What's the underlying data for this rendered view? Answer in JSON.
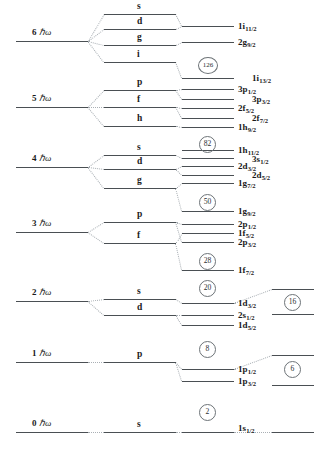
{
  "figure": {
    "type": "energy-level-diagram",
    "width": 315,
    "height": 450,
    "background": "#ffffff",
    "line_color": "#555a5e",
    "connector_color": "#9aa0a5"
  },
  "oscillator_shells": [
    {
      "id": "n6",
      "label": "6 ℏω",
      "n": 6,
      "x": 18,
      "y": 41,
      "line_x": 16,
      "line_w": 72
    },
    {
      "id": "n5",
      "label": "5 ℏω",
      "n": 5,
      "x": 18,
      "y": 107,
      "line_x": 16,
      "line_w": 72
    },
    {
      "id": "n4",
      "label": "4 ℏω",
      "n": 4,
      "x": 18,
      "y": 167,
      "line_x": 16,
      "line_w": 72
    },
    {
      "id": "n3",
      "label": "3 ℏω",
      "n": 3,
      "x": 18,
      "y": 232,
      "line_x": 16,
      "line_w": 72
    },
    {
      "id": "n2",
      "label": "2 ℏω",
      "n": 2,
      "x": 18,
      "y": 301,
      "line_x": 16,
      "line_w": 72
    },
    {
      "id": "n1",
      "label": "1 ℏω",
      "n": 1,
      "x": 18,
      "y": 362,
      "line_x": 16,
      "line_w": 72
    },
    {
      "id": "n0",
      "label": "0 ℏω",
      "n": 0,
      "x": 18,
      "y": 432,
      "line_x": 16,
      "line_w": 72
    }
  ],
  "orbital_letters": [
    {
      "id": "o-6s",
      "label": "s",
      "y": 14,
      "line_x": 104,
      "line_w": 72
    },
    {
      "id": "o-6d",
      "label": "d",
      "y": 29,
      "line_x": 104,
      "line_w": 72
    },
    {
      "id": "o-6g",
      "label": "g",
      "y": 45,
      "line_x": 104,
      "line_w": 72
    },
    {
      "id": "o-6i",
      "label": "i",
      "y": 62,
      "line_x": 104,
      "line_w": 72
    },
    {
      "id": "o-5p",
      "label": "p",
      "y": 90,
      "line_x": 104,
      "line_w": 72
    },
    {
      "id": "o-5f",
      "label": "f",
      "y": 107,
      "line_x": 104,
      "line_w": 72
    },
    {
      "id": "o-5h",
      "label": "h",
      "y": 126,
      "line_x": 104,
      "line_w": 72
    },
    {
      "id": "o-4s",
      "label": "s",
      "y": 155,
      "line_x": 104,
      "line_w": 72
    },
    {
      "id": "o-4d",
      "label": "d",
      "y": 169,
      "line_x": 104,
      "line_w": 72
    },
    {
      "id": "o-4g",
      "label": "g",
      "y": 188,
      "line_x": 104,
      "line_w": 72
    },
    {
      "id": "o-3p",
      "label": "p",
      "y": 222,
      "line_x": 104,
      "line_w": 72
    },
    {
      "id": "o-3f",
      "label": "f",
      "y": 243,
      "line_x": 104,
      "line_w": 72
    },
    {
      "id": "o-2s",
      "label": "s",
      "y": 299,
      "line_x": 104,
      "line_w": 72
    },
    {
      "id": "o-2d",
      "label": "d",
      "y": 315,
      "line_x": 104,
      "line_w": 72
    },
    {
      "id": "o-1p",
      "label": "p",
      "y": 362,
      "line_x": 104,
      "line_w": 72
    },
    {
      "id": "o-0s",
      "label": "s",
      "y": 432,
      "line_x": 104,
      "line_w": 72
    }
  ],
  "spin_orbit_levels": [
    {
      "id": "l-1i11",
      "n": "1",
      "l": "i",
      "j": "11/2",
      "y": 26,
      "line_x": 182,
      "line_w": 52,
      "label_x": 238,
      "label_y": 22
    },
    {
      "id": "l-2g9",
      "n": "2",
      "l": "g",
      "j": "9/2",
      "y": 42,
      "line_x": 182,
      "line_w": 52,
      "label_x": 238,
      "label_y": 38
    },
    {
      "id": "l-1i13",
      "n": "1",
      "l": "i",
      "j": "13/2",
      "y": 78,
      "line_x": 182,
      "line_w": 52,
      "label_x": 252,
      "label_y": 74
    },
    {
      "id": "l-3p1",
      "n": "3",
      "l": "p",
      "j": "1/2",
      "y": 89,
      "line_x": 182,
      "line_w": 52,
      "label_x": 238,
      "label_y": 85
    },
    {
      "id": "l-3p3",
      "n": "3",
      "l": "p",
      "j": "3/2",
      "y": 99,
      "line_x": 182,
      "line_w": 52,
      "label_x": 252,
      "label_y": 95
    },
    {
      "id": "l-2f5",
      "n": "2",
      "l": "f",
      "j": "5/2",
      "y": 108,
      "line_x": 182,
      "line_w": 52,
      "label_x": 238,
      "label_y": 104
    },
    {
      "id": "l-2f7",
      "n": "2",
      "l": "f",
      "j": "7/2",
      "y": 118,
      "line_x": 182,
      "line_w": 52,
      "label_x": 252,
      "label_y": 114
    },
    {
      "id": "l-1h9",
      "n": "1",
      "l": "h",
      "j": "9/2",
      "y": 127,
      "line_x": 182,
      "line_w": 52,
      "label_x": 238,
      "label_y": 123
    },
    {
      "id": "l-1h11",
      "n": "1",
      "l": "h",
      "j": "11/2",
      "y": 150,
      "line_x": 182,
      "line_w": 52,
      "label_x": 238,
      "label_y": 146
    },
    {
      "id": "l-3s1",
      "n": "3",
      "l": "s",
      "j": "1/2",
      "y": 158,
      "line_x": 182,
      "line_w": 52,
      "label_x": 252,
      "label_y": 155
    },
    {
      "id": "l-2d3",
      "n": "2",
      "l": "d",
      "j": "3/2",
      "y": 166,
      "line_x": 182,
      "line_w": 52,
      "label_x": 238,
      "label_y": 162
    },
    {
      "id": "l-2d5",
      "n": "2",
      "l": "d",
      "j": "5/2",
      "y": 175,
      "line_x": 182,
      "line_w": 52,
      "label_x": 252,
      "label_y": 171
    },
    {
      "id": "l-1g7",
      "n": "1",
      "l": "g",
      "j": "7/2",
      "y": 183,
      "line_x": 182,
      "line_w": 52,
      "label_x": 238,
      "label_y": 179
    },
    {
      "id": "l-1g9",
      "n": "1",
      "l": "g",
      "j": "9/2",
      "y": 211,
      "line_x": 182,
      "line_w": 52,
      "label_x": 238,
      "label_y": 207
    },
    {
      "id": "l-2p1",
      "n": "2",
      "l": "p",
      "j": "1/2",
      "y": 224,
      "line_x": 182,
      "line_w": 52,
      "label_x": 238,
      "label_y": 220
    },
    {
      "id": "l-1f5",
      "n": "1",
      "l": "f",
      "j": "5/2",
      "y": 233,
      "line_x": 182,
      "line_w": 52,
      "label_x": 238,
      "label_y": 229
    },
    {
      "id": "l-2p3",
      "n": "2",
      "l": "p",
      "j": "3/2",
      "y": 242,
      "line_x": 182,
      "line_w": 52,
      "label_x": 238,
      "label_y": 238
    },
    {
      "id": "l-1f7",
      "n": "1",
      "l": "f",
      "j": "7/2",
      "y": 270,
      "line_x": 182,
      "line_w": 52,
      "label_x": 238,
      "label_y": 266
    },
    {
      "id": "l-1d3",
      "n": "1",
      "l": "d",
      "j": "3/2",
      "y": 303,
      "line_x": 182,
      "line_w": 52,
      "label_x": 238,
      "label_y": 299
    },
    {
      "id": "l-2s1",
      "n": "2",
      "l": "s",
      "j": "1/2",
      "y": 315,
      "line_x": 182,
      "line_w": 52,
      "label_x": 238,
      "label_y": 311
    },
    {
      "id": "l-1d5",
      "n": "1",
      "l": "d",
      "j": "5/2",
      "y": 325,
      "line_x": 182,
      "line_w": 52,
      "label_x": 238,
      "label_y": 321
    },
    {
      "id": "l-1p1",
      "n": "1",
      "l": "p",
      "j": "1/2",
      "y": 369,
      "line_x": 182,
      "line_w": 52,
      "label_x": 238,
      "label_y": 365
    },
    {
      "id": "l-1p3",
      "n": "1",
      "l": "p",
      "j": "3/2",
      "y": 381,
      "line_x": 182,
      "line_w": 52,
      "label_x": 238,
      "label_y": 377
    },
    {
      "id": "l-1s1",
      "n": "1",
      "l": "s",
      "j": "1/2",
      "y": 432,
      "line_x": 182,
      "line_w": 52,
      "label_x": 238,
      "label_y": 424
    }
  ],
  "far_right_levels": [
    {
      "id": "fr-1",
      "y": 289,
      "line_x": 272,
      "line_w": 42
    },
    {
      "id": "fr-2",
      "y": 314,
      "line_x": 272,
      "line_w": 42
    },
    {
      "id": "fr-3",
      "y": 355,
      "line_x": 272,
      "line_w": 42
    },
    {
      "id": "fr-4",
      "y": 385,
      "line_x": 272,
      "line_w": 42
    },
    {
      "id": "fr-5",
      "y": 432,
      "line_x": 272,
      "line_w": 42
    }
  ],
  "magic_numbers": [
    {
      "id": "m-126",
      "value": "126",
      "x": 198,
      "y": 57,
      "wide": true
    },
    {
      "id": "m-82",
      "value": "82",
      "x": 199,
      "y": 136,
      "wide": false
    },
    {
      "id": "m-50",
      "value": "50",
      "x": 199,
      "y": 194,
      "wide": false
    },
    {
      "id": "m-28",
      "value": "28",
      "x": 199,
      "y": 253,
      "wide": false
    },
    {
      "id": "m-20",
      "value": "20",
      "x": 199,
      "y": 280,
      "wide": false
    },
    {
      "id": "m-16",
      "value": "16",
      "x": 284,
      "y": 294,
      "wide": false
    },
    {
      "id": "m-8",
      "value": "8",
      "x": 199,
      "y": 341,
      "wide": false
    },
    {
      "id": "m-6",
      "value": "6",
      "x": 284,
      "y": 361,
      "wide": false
    },
    {
      "id": "m-2",
      "value": "2",
      "x": 199,
      "y": 404,
      "wide": false
    }
  ],
  "connectors": [
    {
      "id": "c1",
      "x1": 88,
      "y1": 41,
      "x2": 104,
      "y2": 14,
      "style": "dotted"
    },
    {
      "id": "c2",
      "x1": 88,
      "y1": 41,
      "x2": 104,
      "y2": 29,
      "style": "dotted"
    },
    {
      "id": "c3",
      "x1": 88,
      "y1": 41,
      "x2": 104,
      "y2": 45,
      "style": "dotted"
    },
    {
      "id": "c4",
      "x1": 88,
      "y1": 41,
      "x2": 104,
      "y2": 62,
      "style": "dotted"
    },
    {
      "id": "c5",
      "x1": 176,
      "y1": 14,
      "x2": 182,
      "y2": 26,
      "style": "dotted"
    },
    {
      "id": "c6",
      "x1": 176,
      "y1": 29,
      "x2": 182,
      "y2": 26,
      "style": "dotted"
    },
    {
      "id": "c7",
      "x1": 176,
      "y1": 45,
      "x2": 182,
      "y2": 42,
      "style": "dotted"
    },
    {
      "id": "c8",
      "x1": 176,
      "y1": 62,
      "x2": 182,
      "y2": 78,
      "style": "dotted"
    },
    {
      "id": "c9",
      "x1": 88,
      "y1": 107,
      "x2": 104,
      "y2": 90,
      "style": "dotted"
    },
    {
      "id": "c10",
      "x1": 88,
      "y1": 107,
      "x2": 104,
      "y2": 107,
      "style": "dotted"
    },
    {
      "id": "c11",
      "x1": 88,
      "y1": 107,
      "x2": 104,
      "y2": 126,
      "style": "dotted"
    },
    {
      "id": "c12",
      "x1": 176,
      "y1": 90,
      "x2": 182,
      "y2": 89,
      "style": "dotted"
    },
    {
      "id": "c13",
      "x1": 176,
      "y1": 90,
      "x2": 182,
      "y2": 99,
      "style": "dotted"
    },
    {
      "id": "c14",
      "x1": 176,
      "y1": 107,
      "x2": 182,
      "y2": 108,
      "style": "dotted"
    },
    {
      "id": "c15",
      "x1": 176,
      "y1": 107,
      "x2": 182,
      "y2": 118,
      "style": "dotted"
    },
    {
      "id": "c16",
      "x1": 176,
      "y1": 126,
      "x2": 182,
      "y2": 127,
      "style": "dotted"
    },
    {
      "id": "c17",
      "x1": 88,
      "y1": 167,
      "x2": 104,
      "y2": 155,
      "style": "dotted"
    },
    {
      "id": "c18",
      "x1": 88,
      "y1": 167,
      "x2": 104,
      "y2": 169,
      "style": "dotted"
    },
    {
      "id": "c19",
      "x1": 88,
      "y1": 167,
      "x2": 104,
      "y2": 188,
      "style": "dotted"
    },
    {
      "id": "c20",
      "x1": 176,
      "y1": 155,
      "x2": 182,
      "y2": 158,
      "style": "dotted"
    },
    {
      "id": "c21",
      "x1": 176,
      "y1": 169,
      "x2": 182,
      "y2": 166,
      "style": "dotted"
    },
    {
      "id": "c22",
      "x1": 176,
      "y1": 169,
      "x2": 182,
      "y2": 175,
      "style": "dotted"
    },
    {
      "id": "c23",
      "x1": 176,
      "y1": 188,
      "x2": 182,
      "y2": 183,
      "style": "dotted"
    },
    {
      "id": "c24",
      "x1": 176,
      "y1": 188,
      "x2": 182,
      "y2": 211,
      "style": "dotted"
    },
    {
      "id": "c25",
      "x1": 88,
      "y1": 232,
      "x2": 104,
      "y2": 222,
      "style": "dotted"
    },
    {
      "id": "c26",
      "x1": 88,
      "y1": 232,
      "x2": 104,
      "y2": 243,
      "style": "dotted"
    },
    {
      "id": "c27",
      "x1": 176,
      "y1": 222,
      "x2": 182,
      "y2": 224,
      "style": "dotted"
    },
    {
      "id": "c28",
      "x1": 176,
      "y1": 222,
      "x2": 182,
      "y2": 242,
      "style": "dotted"
    },
    {
      "id": "c29",
      "x1": 176,
      "y1": 243,
      "x2": 182,
      "y2": 233,
      "style": "dotted"
    },
    {
      "id": "c30",
      "x1": 176,
      "y1": 243,
      "x2": 182,
      "y2": 270,
      "style": "dotted"
    },
    {
      "id": "c31",
      "x1": 88,
      "y1": 301,
      "x2": 104,
      "y2": 299,
      "style": "dotted"
    },
    {
      "id": "c32",
      "x1": 88,
      "y1": 301,
      "x2": 104,
      "y2": 315,
      "style": "dotted"
    },
    {
      "id": "c33",
      "x1": 176,
      "y1": 299,
      "x2": 182,
      "y2": 303,
      "style": "dotted"
    },
    {
      "id": "c34",
      "x1": 176,
      "y1": 315,
      "x2": 182,
      "y2": 315,
      "style": "dotted"
    },
    {
      "id": "c35",
      "x1": 176,
      "y1": 315,
      "x2": 182,
      "y2": 325,
      "style": "dotted"
    },
    {
      "id": "c36",
      "x1": 234,
      "y1": 303,
      "x2": 272,
      "y2": 289,
      "style": "dotted"
    },
    {
      "id": "c37",
      "x1": 88,
      "y1": 362,
      "x2": 104,
      "y2": 362,
      "style": "dotted"
    },
    {
      "id": "c38",
      "x1": 176,
      "y1": 362,
      "x2": 182,
      "y2": 369,
      "style": "dotted"
    },
    {
      "id": "c39",
      "x1": 176,
      "y1": 362,
      "x2": 182,
      "y2": 381,
      "style": "dotted"
    },
    {
      "id": "c40",
      "x1": 234,
      "y1": 369,
      "x2": 272,
      "y2": 355,
      "style": "dotted"
    },
    {
      "id": "c41",
      "x1": 88,
      "y1": 432,
      "x2": 104,
      "y2": 432,
      "style": "dotted"
    },
    {
      "id": "c42",
      "x1": 176,
      "y1": 432,
      "x2": 182,
      "y2": 432,
      "style": "dotted"
    },
    {
      "id": "c43",
      "x1": 234,
      "y1": 432,
      "x2": 272,
      "y2": 432,
      "style": "dotted"
    }
  ]
}
